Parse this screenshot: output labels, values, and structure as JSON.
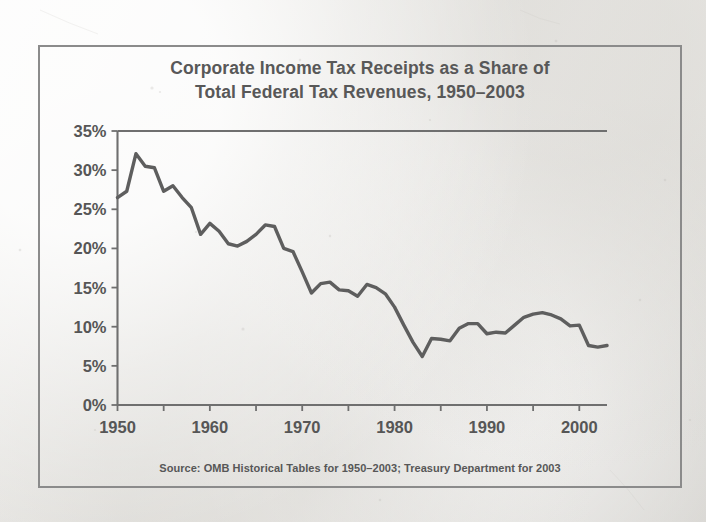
{
  "figure": {
    "title_line1": "Corporate Income Tax Receipts as a Share of",
    "title_line2": "Total Federal Tax Revenues, 1950–2003",
    "source": "Source: OMB Historical Tables for 1950–2003; Treasury Department for 2003",
    "line_color": "#5e5e5e",
    "axis_color": "#6f6f6f",
    "border_color": "#8b8b8b",
    "text_color": "#565656",
    "background_color": "#eceae7"
  },
  "chart_data": {
    "type": "line",
    "title": "Corporate Income Tax Receipts as a Share of Total Federal Tax Revenues, 1950–2003",
    "xlabel": "",
    "ylabel": "",
    "ylim": [
      0,
      35
    ],
    "xlim": [
      1950,
      2003
    ],
    "grid": false,
    "legend": false,
    "y_tick_labels": [
      "0%",
      "5%",
      "10%",
      "15%",
      "20%",
      "25%",
      "30%",
      "35%"
    ],
    "y_ticks": [
      0,
      5,
      10,
      15,
      20,
      25,
      30,
      35
    ],
    "x_tick_labels": [
      "1950",
      "1960",
      "1970",
      "1980",
      "1990",
      "2000"
    ],
    "x_ticks_major": [
      1950,
      1960,
      1970,
      1980,
      1990,
      2000
    ],
    "x_ticks_minor": [
      1955,
      1965,
      1975,
      1985,
      1995
    ],
    "x": [
      1950,
      1951,
      1952,
      1953,
      1954,
      1955,
      1956,
      1957,
      1958,
      1959,
      1960,
      1961,
      1962,
      1963,
      1964,
      1965,
      1966,
      1967,
      1968,
      1969,
      1970,
      1971,
      1972,
      1973,
      1974,
      1975,
      1976,
      1977,
      1978,
      1979,
      1980,
      1981,
      1982,
      1983,
      1984,
      1985,
      1986,
      1987,
      1988,
      1989,
      1990,
      1991,
      1992,
      1993,
      1994,
      1995,
      1996,
      1997,
      1998,
      1999,
      2000,
      2001,
      2002,
      2003
    ],
    "values": [
      26.5,
      27.3,
      32.1,
      30.5,
      30.3,
      27.3,
      28.0,
      26.5,
      25.2,
      21.8,
      23.2,
      22.2,
      20.6,
      20.3,
      20.9,
      21.8,
      23.0,
      22.8,
      20.0,
      19.6,
      17.0,
      14.3,
      15.5,
      15.7,
      14.7,
      14.6,
      13.9,
      15.4,
      15.0,
      14.2,
      12.5,
      10.2,
      8.0,
      6.2,
      8.5,
      8.4,
      8.2,
      9.8,
      10.4,
      10.4,
      9.1,
      9.3,
      9.2,
      10.2,
      11.2,
      11.6,
      11.8,
      11.5,
      11.0,
      10.1,
      10.2,
      7.6,
      7.4,
      7.6
    ],
    "series": [
      {
        "name": "Corporate income tax share of total federal tax revenues (%)",
        "values": [
          26.5,
          27.3,
          32.1,
          30.5,
          30.3,
          27.3,
          28.0,
          26.5,
          25.2,
          21.8,
          23.2,
          22.2,
          20.6,
          20.3,
          20.9,
          21.8,
          23.0,
          22.8,
          20.0,
          19.6,
          17.0,
          14.3,
          15.5,
          15.7,
          14.7,
          14.6,
          13.9,
          15.4,
          15.0,
          14.2,
          12.5,
          10.2,
          8.0,
          6.2,
          8.5,
          8.4,
          8.2,
          9.8,
          10.4,
          10.4,
          9.1,
          9.3,
          9.2,
          10.2,
          11.2,
          11.6,
          11.8,
          11.5,
          11.0,
          10.1,
          10.2,
          7.6,
          7.4,
          7.6
        ]
      }
    ]
  }
}
